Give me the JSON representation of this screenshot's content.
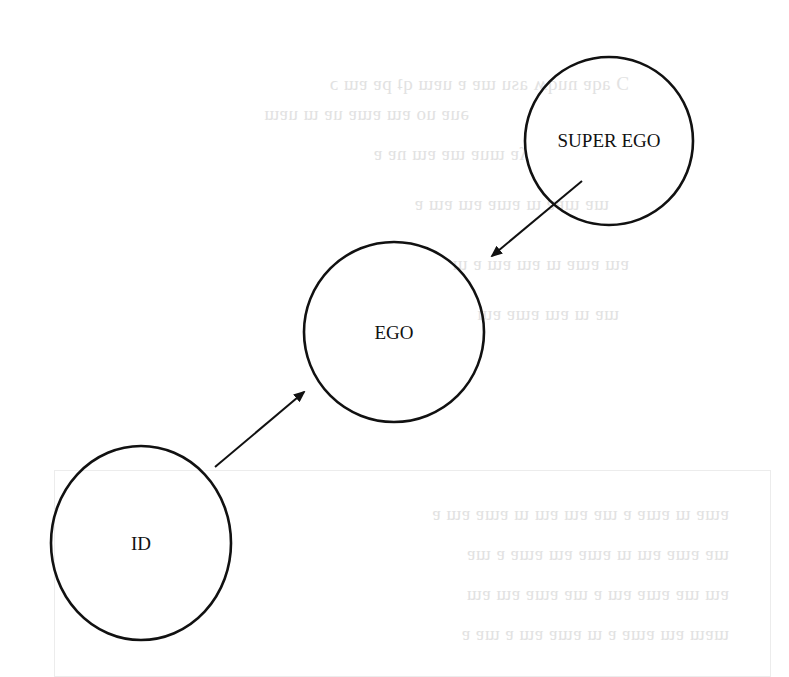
{
  "diagram": {
    "nodes": [
      {
        "id": "super_ego",
        "label": "SUPER EGO",
        "cx": 609,
        "cy": 141,
        "r": 84
      },
      {
        "id": "ego",
        "label": "EGO",
        "cx": 394,
        "cy": 332,
        "r": 90
      },
      {
        "id": "id",
        "label": "ID",
        "cx": 141,
        "cy": 543,
        "rx": 90,
        "ry": 97
      }
    ],
    "edges": [
      {
        "from": "super_ego",
        "to": "ego",
        "label": ""
      },
      {
        "from": "id",
        "to": "ego",
        "label": ""
      }
    ],
    "colors": {
      "stroke": "#111111",
      "background": "#ffffff",
      "bleed_text": "#e2e2e2"
    }
  }
}
